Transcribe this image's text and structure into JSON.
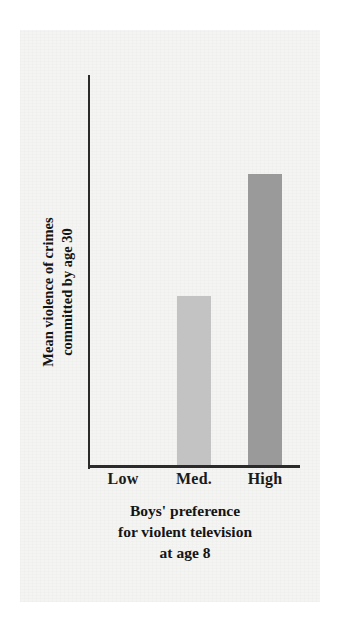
{
  "chart_data": {
    "type": "bar",
    "title": "",
    "subtitle": "",
    "categories": [
      "Low",
      "Med.",
      "High"
    ],
    "values": [
      0,
      0.58,
      1.0
    ],
    "series": [
      {
        "name": "Mean violence of crimes committed by age 30",
        "values": [
          0,
          0.58,
          1.0
        ]
      }
    ],
    "xlabel": "Boys' preference for violent television at age 8",
    "ylabel": "Mean violence of crimes committed by age 30",
    "ylim": [
      0,
      1.12
    ],
    "grid": false,
    "legend": false,
    "legend_position": "none",
    "y_tick_labels": [],
    "x_tick_labels": [
      "Low",
      "Med.",
      "High"
    ],
    "bar_colors": [
      "#f4f4f2",
      "#c3c3c3",
      "#9a9a9a"
    ],
    "axis_color": "#2b2b2b",
    "background_color": "#f4f4f2",
    "annotations": []
  },
  "axes": {
    "y_title_lines": [
      "Mean violence of crimes",
      "committed by age 30"
    ],
    "x_title_lines": [
      "Boys' preference",
      "for violent television",
      "at age 8"
    ]
  },
  "ticks": {
    "x": [
      {
        "label": "Low"
      },
      {
        "label": "Med."
      },
      {
        "label": "High"
      }
    ]
  },
  "bars": [
    {
      "category": "Low",
      "value": 0,
      "color": "#f4f4f2",
      "height_pct": "0%"
    },
    {
      "category": "Med.",
      "value": 0.58,
      "color": "#c3c3c3",
      "height_pct": "47.5%"
    },
    {
      "category": "High",
      "value": 1.0,
      "color": "#9a9a9a",
      "height_pct": "82%"
    }
  ],
  "colors": {
    "medium_bar": "#c3c3c3",
    "high_bar": "#9a9a9a",
    "axis": "#2b2b2b",
    "paper": "#f4f4f2",
    "text": "#141414"
  }
}
